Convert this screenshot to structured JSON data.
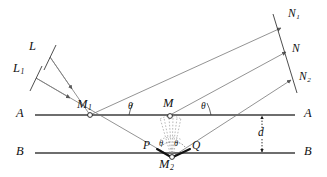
{
  "figure": {
    "background": "#ffffff",
    "ink": "#111111",
    "ray_color": "#7a7a7a",
    "surface_color": "#6e6e6e",
    "dash_color": "#9a9a9a",
    "width": 327,
    "height": 177
  },
  "labels": {
    "wavefront_L": "L",
    "wavefront_L1_base": "L",
    "wavefront_L1_sub": "1",
    "normal_N1_base": "N",
    "normal_N1_sub": "1",
    "normal_N": "N",
    "normal_N2_base": "N",
    "normal_N2_sub": "2",
    "point_M1_base": "M",
    "point_M1_sub": "1",
    "point_M": "M",
    "point_M2_base": "M",
    "point_M2_sub": "2",
    "point_P": "P",
    "point_Q": "Q",
    "surface_A_left": "A",
    "surface_A_right": "A",
    "surface_B_left": "B",
    "surface_B_right": "B",
    "angle_theta_left": "θ",
    "angle_theta_right": "θ",
    "angle_theta_lower_left": "θ",
    "angle_theta_lower_right": "θ",
    "separation_d": "d"
  },
  "geometry": {
    "surface_A_y": 115,
    "surface_B_y": 153,
    "surface_x_start": 35,
    "surface_x_end": 295,
    "point_M1": [
      90,
      115
    ],
    "point_M": [
      170,
      115
    ],
    "point_M2": [
      172,
      157
    ],
    "point_P": [
      157,
      152
    ],
    "point_Q": [
      189,
      152
    ],
    "separation_label_x": 262,
    "incident_angle_deg": 28,
    "reflected_angle_deg": 28
  }
}
